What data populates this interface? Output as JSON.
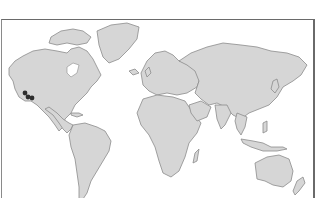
{
  "map": {
    "type": "world-map",
    "style": "grayscale",
    "colors": {
      "land": "#d6d6d6",
      "coastline": "#8c8c8c",
      "ocean": "#ffffff",
      "border": "#6a6a6a",
      "marker": "#2e2e2e"
    },
    "regions": [
      "North America",
      "Greenland",
      "South America",
      "Europe",
      "Africa",
      "Asia",
      "Australia",
      "New Zealand"
    ],
    "markers": [
      {
        "name": "marker-1",
        "region": "Southwestern United States",
        "x": 24,
        "y": 92
      },
      {
        "name": "marker-2",
        "region": "Southwestern United States",
        "x": 27,
        "y": 96
      },
      {
        "name": "marker-3",
        "region": "Southwestern United States",
        "x": 31,
        "y": 97
      }
    ]
  }
}
